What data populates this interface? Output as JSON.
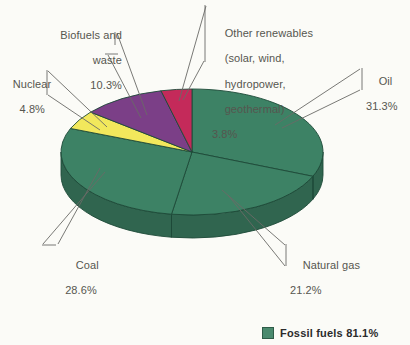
{
  "chart_data": {
    "type": "pie",
    "title": "",
    "subtitle": "",
    "xlabel": "",
    "ylabel": "",
    "units": "percent",
    "grid": false,
    "legend_position": "bottom-right",
    "categories": [
      "Oil",
      "Natural gas",
      "Coal",
      "Nuclear",
      "Biofuels and waste",
      "Other renewables (solar, wind, hydropower, geothermal)"
    ],
    "values": [
      31.3,
      21.2,
      28.6,
      4.8,
      10.3,
      3.8
    ],
    "colors": [
      "#3d8265",
      "#3d8265",
      "#3d8265",
      "#f2e85c",
      "#7b3f87",
      "#c42a5a"
    ],
    "slices": [
      {
        "name": "Oil",
        "label": "Oil",
        "value": 31.3,
        "pct": "31.3%",
        "color": "#3d8265",
        "group": "Fossil fuels"
      },
      {
        "name": "Natural gas",
        "label": "Natural gas",
        "value": 21.2,
        "pct": "21.2%",
        "color": "#3d8265",
        "group": "Fossil fuels"
      },
      {
        "name": "Coal",
        "label": "Coal",
        "value": 28.6,
        "pct": "28.6%",
        "color": "#3d8265",
        "group": "Fossil fuels"
      },
      {
        "name": "Nuclear",
        "label": "Nuclear",
        "value": 4.8,
        "pct": "4.8%",
        "color": "#f2e85c",
        "group": ""
      },
      {
        "name": "Biofuels and waste",
        "label": "Biofuels and\nwaste",
        "value": 10.3,
        "pct": "10.3%",
        "color": "#7b3f87",
        "group": ""
      },
      {
        "name": "Other renewables",
        "label": "Other renewables\n(solar, wind,\nhydropower,\ngeothermal)",
        "value": 3.8,
        "pct": "3.8%",
        "color": "#c42a5a",
        "group": ""
      }
    ],
    "legend": [
      {
        "label": "Fossil fuels 81.1%",
        "color": "#4a8a6e",
        "value": 81.1
      }
    ]
  },
  "labels": {
    "biofuels_line1": "Biofuels and",
    "biofuels_line2": "waste",
    "biofuels_pct": "10.3%",
    "nuclear_line1": "Nuclear",
    "nuclear_pct": "4.8%",
    "renewables_line1": "Other renewables",
    "renewables_line2": "(solar, wind,",
    "renewables_line3": "hydropower,",
    "renewables_line4": "geothermal)",
    "renewables_pct": "3.8%",
    "oil_line1": "Oil",
    "oil_pct": "31.3%",
    "coal_line1": "Coal",
    "coal_pct": "28.6%",
    "gas_line1": "Natural gas",
    "gas_pct": "21.2%"
  },
  "legend": {
    "fossil_label": "Fossil fuels 81.1%",
    "swatch_color": "#4a8a6e"
  },
  "colors": {
    "background": "#fbfbf7",
    "green": "#3d8265",
    "green_side": "#2f6a51",
    "purple": "#7b3f87",
    "yellow": "#f2e85c",
    "crimson": "#c42a5a",
    "outline": "#1d4a38",
    "text": "#56564f"
  }
}
